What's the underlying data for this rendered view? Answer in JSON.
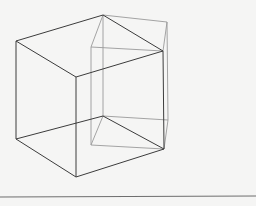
{
  "figure": {
    "background": "#f5f5f4",
    "colors": {
      "main_edge": "#3c3c3c",
      "ghost_edge": "#9a9a9a",
      "baseline": "#6e6e6e"
    },
    "main_cube": {
      "vertices": {
        "top_back": [
          103,
          15
        ],
        "top_left": [
          16,
          41
        ],
        "top_front": [
          76,
          77
        ],
        "top_right": [
          163,
          51
        ],
        "bottom_back": [
          103,
          116
        ],
        "bottom_left": [
          16,
          139
        ],
        "bottom_front": [
          76,
          177
        ],
        "bottom_right": [
          164,
          149
        ]
      }
    },
    "ghost_cube": {
      "vertices": {
        "top_back": [
          103,
          15
        ],
        "top_far_right": [
          167,
          22
        ],
        "top_inner_left": [
          91,
          47
        ],
        "top_right": [
          163,
          51
        ],
        "bottom_back": [
          103,
          116
        ],
        "bottom_far_right": [
          168,
          120
        ],
        "bottom_inner_left": [
          91,
          145
        ],
        "bottom_right": [
          164,
          149
        ]
      }
    },
    "baseline": {
      "y": 197,
      "x1": 0,
      "x2": 256
    }
  }
}
